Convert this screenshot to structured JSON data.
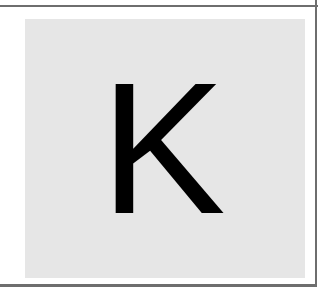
{
  "tile": {
    "letter": "K",
    "background_color": "#e6e6e6",
    "letter_color": "#000000"
  },
  "frame": {
    "line_color": "#6e6e6e"
  }
}
